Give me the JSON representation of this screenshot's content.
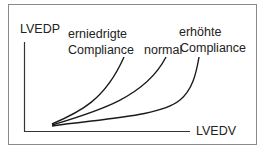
{
  "diagram": {
    "y_axis_label": "LVEDP",
    "x_axis_label": "LVEDV",
    "curves": [
      {
        "line1": "erniedrigte",
        "line2": "Compliance"
      },
      {
        "line1": "",
        "line2": "normal"
      },
      {
        "line1": "erhöhte",
        "line2": "Compliance"
      }
    ],
    "colors": {
      "line": "#1a1a1a",
      "frame": "#8a8a8a"
    }
  }
}
